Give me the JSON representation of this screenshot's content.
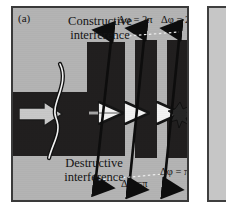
{
  "figure": {
    "panel_label": "(a)",
    "type": "wave-interference-schematic",
    "background_color": "#b4b4b4",
    "structure_color": "#211f1f",
    "frame_color": "#3a3a3a"
  },
  "annotations": {
    "constructive_line1": "Constructive",
    "constructive_line2": "interference",
    "destructive_line1": "Destructive",
    "destructive_line2": "interference"
  },
  "phase_labels": {
    "top": [
      {
        "text": "Δφ = 2π"
      },
      {
        "text": "Δφ = 2π"
      }
    ],
    "bottom": [
      {
        "text": "Δφ =π"
      },
      {
        "text": "Δφ = π"
      }
    ]
  },
  "icons": {
    "input_arrow": "block-arrow-right-icon",
    "wave_curve": "s-wave-curve-icon",
    "propagation_arrows": "arrow-right-outline-icon",
    "scatter_burst": "starburst-scatter-icon",
    "phase_arrows": "double-headed-arrow-icon",
    "connector": "dotted-connector-line-icon"
  }
}
